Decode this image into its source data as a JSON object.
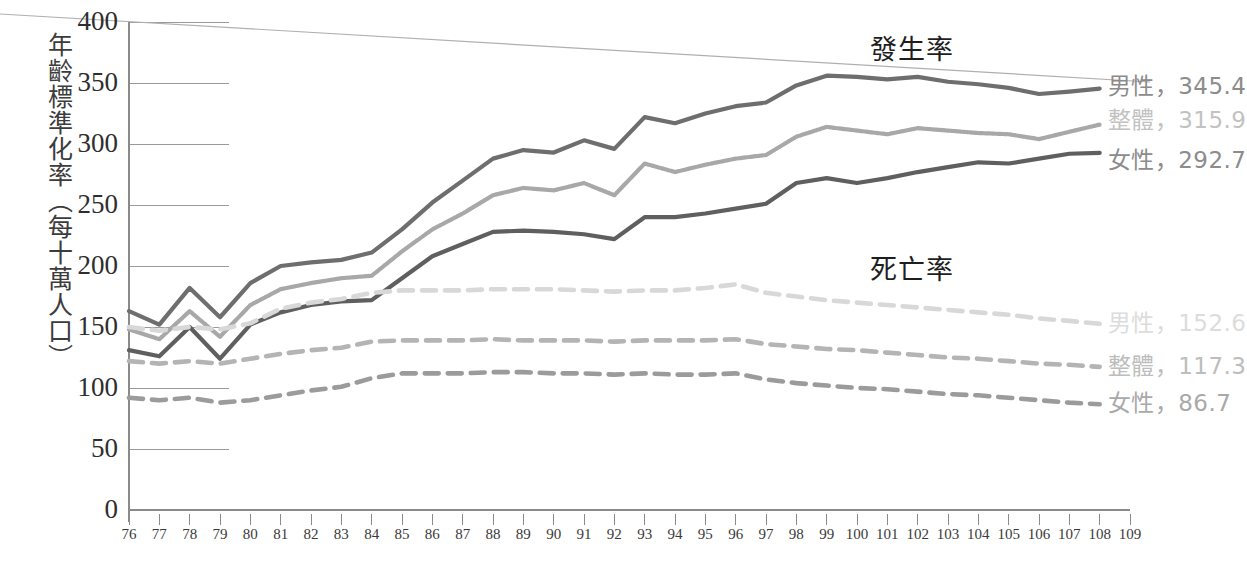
{
  "axes": {
    "y_title": "年齡標準化率（每十萬人口）",
    "y_ticks": [
      "400",
      "350",
      "300",
      "250",
      "200",
      "150",
      "100",
      "50",
      "0"
    ],
    "y_min": 0,
    "y_max": 400,
    "y_step": 50,
    "x_ticks": [
      "76",
      "77",
      "78",
      "79",
      "80",
      "81",
      "82",
      "83",
      "84",
      "85",
      "86",
      "87",
      "88",
      "89",
      "90",
      "91",
      "92",
      "93",
      "94",
      "95",
      "96",
      "97",
      "98",
      "99",
      "100",
      "101",
      "102",
      "103",
      "104",
      "105",
      "106",
      "107",
      "108",
      "109"
    ]
  },
  "groups": {
    "incidence_title": "發生率",
    "mortality_title": "死亡率"
  },
  "labels": {
    "incidence_male": "男性，345.4",
    "incidence_total": "整體，315.9",
    "incidence_female": "女性，292.7",
    "mortality_male": "男性，152.6",
    "mortality_total": "整體，117.3",
    "mortality_female": "女性，86.7"
  },
  "colors": {
    "incidence_male": "#6e6e6e",
    "incidence_total": "#a8a8a8",
    "incidence_female": "#5f5f5f",
    "mortality_male": "#d8d8d8",
    "mortality_total": "#b4b4b4",
    "mortality_female": "#9b9b9b",
    "axis": "#8a8a8a",
    "grid": "#9a9a9a",
    "text": "#2e2e2e",
    "label_text": "#8e8e8e",
    "artifact": "#b0b0b0"
  },
  "chart_data": {
    "type": "line",
    "title": "",
    "xlabel": "",
    "ylabel": "年齡標準化率（每十萬人口）",
    "xlim": [
      76,
      109
    ],
    "ylim": [
      0,
      400
    ],
    "grid": true,
    "legend_position": "right-inline-end-of-line",
    "x": [
      76,
      77,
      78,
      79,
      80,
      81,
      82,
      83,
      84,
      85,
      86,
      87,
      88,
      89,
      90,
      91,
      92,
      93,
      94,
      95,
      96,
      97,
      98,
      99,
      100,
      101,
      102,
      103,
      104,
      105,
      106,
      107,
      108,
      109
    ],
    "series": [
      {
        "name": "發生率 男性",
        "style": "solid",
        "end_value": 345.4,
        "values": [
          163,
          152,
          182,
          158,
          186,
          200,
          203,
          205,
          211,
          230,
          252,
          270,
          288,
          295,
          293,
          303,
          296,
          322,
          317,
          325,
          331,
          334,
          348,
          356,
          355,
          353,
          355,
          351,
          349,
          346,
          341,
          343,
          345.4,
          null
        ]
      },
      {
        "name": "發生率 整體",
        "style": "solid-textured",
        "end_value": 315.9,
        "values": [
          148,
          140,
          163,
          142,
          168,
          181,
          186,
          190,
          192,
          212,
          230,
          243,
          258,
          264,
          262,
          268,
          258,
          284,
          277,
          283,
          288,
          291,
          306,
          314,
          311,
          308,
          313,
          311,
          309,
          308,
          304,
          310,
          315.9,
          null
        ]
      },
      {
        "name": "發生率 女性",
        "style": "solid",
        "end_value": 292.7,
        "values": [
          131,
          126,
          150,
          124,
          152,
          162,
          168,
          171,
          172,
          190,
          208,
          218,
          228,
          229,
          228,
          226,
          222,
          240,
          240,
          243,
          247,
          251,
          268,
          272,
          268,
          272,
          277,
          281,
          285,
          284,
          288,
          292,
          292.7,
          null
        ]
      },
      {
        "name": "死亡率 男性",
        "style": "dashed",
        "end_value": 152.6,
        "values": [
          150,
          147,
          150,
          148,
          153,
          165,
          170,
          173,
          178,
          180,
          180,
          180,
          181,
          181,
          181,
          180,
          179,
          180,
          180,
          182,
          185,
          178,
          175,
          172,
          170,
          168,
          166,
          164,
          162,
          160,
          157,
          155,
          152.6,
          null
        ]
      },
      {
        "name": "死亡率 整體",
        "style": "dashed-textured",
        "end_value": 117.3,
        "values": [
          122,
          120,
          122,
          120,
          124,
          128,
          131,
          133,
          138,
          139,
          139,
          139,
          140,
          139,
          139,
          139,
          138,
          139,
          139,
          139,
          140,
          136,
          134,
          132,
          131,
          129,
          127,
          125,
          124,
          122,
          120,
          119,
          117.3,
          null
        ]
      },
      {
        "name": "死亡率 女性",
        "style": "dashed",
        "end_value": 86.7,
        "values": [
          92,
          90,
          92,
          88,
          90,
          94,
          98,
          101,
          108,
          112,
          112,
          112,
          113,
          113,
          112,
          112,
          111,
          112,
          111,
          111,
          112,
          107,
          104,
          102,
          100,
          99,
          97,
          95,
          94,
          92,
          90,
          88,
          86.7,
          null
        ]
      }
    ]
  }
}
